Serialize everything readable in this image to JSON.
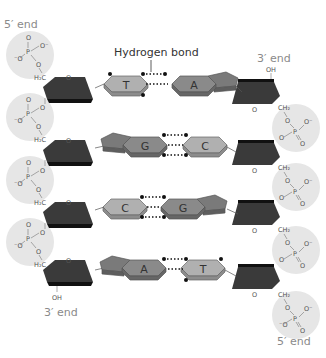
{
  "diagram": {
    "title_callout": "Hydrogen bond",
    "left_strand": {
      "top_label": "5′ end",
      "bottom_label": "3′ end",
      "bottom_group": "OH"
    },
    "right_strand": {
      "top_label": "3′ end",
      "top_group": "OH",
      "bottom_label": "5′ end"
    },
    "base_pairs": [
      {
        "left": "T",
        "right": "A",
        "hydrogen_bonds": 2
      },
      {
        "left": "G",
        "right": "C",
        "hydrogen_bonds": 3
      },
      {
        "left": "C",
        "right": "G",
        "hydrogen_bonds": 3
      },
      {
        "left": "A",
        "right": "T",
        "hydrogen_bonds": 2
      }
    ],
    "phosphate": {
      "P": "P",
      "O": "O",
      "O_minus": "O⁻",
      "minus_O": "⁻O",
      "H2C": "H₂C",
      "CH2": "CH₂"
    },
    "colors": {
      "sugar": "#3a3a3a",
      "purine": "#7a7a7a",
      "pyrimidine": "#a8a8a8",
      "phosphate_bg": "#e6e6e6",
      "label_grey": "#8a8a8a"
    }
  }
}
